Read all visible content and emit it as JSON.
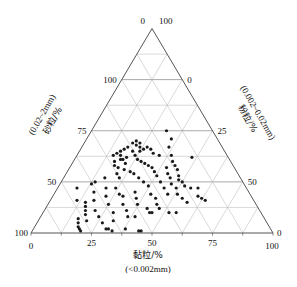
{
  "figure": {
    "title": "",
    "background_color": "#ffffff",
    "width": 297,
    "height": 287
  },
  "axes": {
    "bottom": {
      "name": "clay",
      "label_cjk": "黏粒/%",
      "label_range": "(<0.002mm)",
      "ticks": [
        "0",
        "25",
        "50",
        "75",
        "100"
      ],
      "tick_values": [
        0,
        25,
        50,
        75,
        100
      ],
      "direction": "left-to-right"
    },
    "left": {
      "name": "sand",
      "label_cjk": "砂粒/%",
      "label_range": "(0.02~2mm)",
      "ticks": [
        "100",
        "75",
        "50",
        "25",
        "0"
      ],
      "tick_values": [
        100,
        75,
        50,
        25,
        0
      ],
      "direction": "bottom-to-top"
    },
    "right": {
      "name": "silt",
      "label_cjk": "粉粒/%",
      "label_range": "(0.002~0.02mm)",
      "ticks": [
        "0",
        "25",
        "50",
        "75",
        "100"
      ],
      "tick_values": [
        0,
        25,
        50,
        75,
        100
      ],
      "direction": "bottom-to-top"
    }
  },
  "corner_labels": {
    "top_left_of_apex": "0",
    "top_right_of_apex": "100",
    "bottom_left_upper": "100",
    "bottom_left_lower": "0",
    "bottom_right_upper": "0",
    "bottom_right_lower": "100"
  },
  "style": {
    "border_color": "#555555",
    "grid_color": "#b9b9b9",
    "grid_major_color": "#9a9a9a",
    "point_color": "#1a1a1a",
    "point_radius": 1.6,
    "grid_interval": 12.5,
    "grid_labeled_interval": 25
  },
  "chart_data": {
    "type": "scatter",
    "subtype": "ternary",
    "title": "",
    "xlabel": "黏粒/% (<0.002mm)",
    "ylabel": "砂粒/% (0.02~2mm)",
    "zlabel": "粉粒/% (0.002~0.02mm)",
    "axis_order": [
      "clay",
      "silt",
      "sand"
    ],
    "xlim": [
      0,
      100
    ],
    "grid": true,
    "legend": "none",
    "n_points": 118,
    "series": [
      {
        "name": "soil samples",
        "marker": "filled-circle",
        "color": "#1a1a1a",
        "points": [
          {
            "clay": 31,
            "silt": 19,
            "sand": 50
          },
          {
            "clay": 35,
            "silt": 19,
            "sand": 46
          },
          {
            "clay": 36,
            "silt": 22,
            "sand": 42
          },
          {
            "clay": 39,
            "silt": 23,
            "sand": 38
          },
          {
            "clay": 41,
            "silt": 24,
            "sand": 35
          },
          {
            "clay": 43,
            "silt": 24,
            "sand": 33
          },
          {
            "clay": 45,
            "silt": 24,
            "sand": 31
          },
          {
            "clay": 47,
            "silt": 25,
            "sand": 28
          },
          {
            "clay": 48,
            "silt": 26,
            "sand": 26
          },
          {
            "clay": 50,
            "silt": 25,
            "sand": 25
          },
          {
            "clay": 52,
            "silt": 25,
            "sand": 23
          },
          {
            "clay": 55,
            "silt": 23,
            "sand": 22
          },
          {
            "clay": 58,
            "silt": 20,
            "sand": 22
          },
          {
            "clay": 60,
            "silt": 22,
            "sand": 18
          },
          {
            "clay": 62,
            "silt": 21,
            "sand": 17
          },
          {
            "clay": 64,
            "silt": 20,
            "sand": 16
          },
          {
            "clay": 40,
            "silt": 28,
            "sand": 32
          },
          {
            "clay": 42,
            "silt": 29,
            "sand": 29
          },
          {
            "clay": 44,
            "silt": 29,
            "sand": 27
          },
          {
            "clay": 46,
            "silt": 30,
            "sand": 24
          },
          {
            "clay": 49,
            "silt": 29,
            "sand": 22
          },
          {
            "clay": 51,
            "silt": 30,
            "sand": 19
          },
          {
            "clay": 54,
            "silt": 29,
            "sand": 17
          },
          {
            "clay": 57,
            "silt": 28,
            "sand": 15
          },
          {
            "clay": 34,
            "silt": 28,
            "sand": 38
          },
          {
            "clay": 31,
            "silt": 30,
            "sand": 39
          },
          {
            "clay": 29,
            "silt": 30,
            "sand": 41
          },
          {
            "clay": 27,
            "silt": 31,
            "sand": 42
          },
          {
            "clay": 26,
            "silt": 33,
            "sand": 41
          },
          {
            "clay": 25,
            "silt": 35,
            "sand": 40
          },
          {
            "clay": 24,
            "silt": 34,
            "sand": 42
          },
          {
            "clay": 23,
            "silt": 33,
            "sand": 44
          },
          {
            "clay": 22,
            "silt": 35,
            "sand": 43
          },
          {
            "clay": 21,
            "silt": 34,
            "sand": 45
          },
          {
            "clay": 20,
            "silt": 36,
            "sand": 44
          },
          {
            "clay": 22,
            "silt": 38,
            "sand": 40
          },
          {
            "clay": 24,
            "silt": 38,
            "sand": 38
          },
          {
            "clay": 26,
            "silt": 38,
            "sand": 36
          },
          {
            "clay": 28,
            "silt": 37,
            "sand": 35
          },
          {
            "clay": 30,
            "silt": 36,
            "sand": 34
          },
          {
            "clay": 32,
            "silt": 35,
            "sand": 33
          },
          {
            "clay": 34,
            "silt": 34,
            "sand": 32
          },
          {
            "clay": 36,
            "silt": 34,
            "sand": 30
          },
          {
            "clay": 38,
            "silt": 34,
            "sand": 28
          },
          {
            "clay": 41,
            "silt": 34,
            "sand": 25
          },
          {
            "clay": 44,
            "silt": 34,
            "sand": 22
          },
          {
            "clay": 47,
            "silt": 34,
            "sand": 19
          },
          {
            "clay": 19,
            "silt": 39,
            "sand": 42
          },
          {
            "clay": 18,
            "silt": 41,
            "sand": 41
          },
          {
            "clay": 17,
            "silt": 43,
            "sand": 40
          },
          {
            "clay": 18,
            "silt": 44,
            "sand": 38
          },
          {
            "clay": 19,
            "silt": 45,
            "sand": 36
          },
          {
            "clay": 20,
            "silt": 44,
            "sand": 36
          },
          {
            "clay": 21,
            "silt": 42,
            "sand": 37
          },
          {
            "clay": 22,
            "silt": 44,
            "sand": 34
          },
          {
            "clay": 23,
            "silt": 46,
            "sand": 31
          },
          {
            "clay": 16,
            "silt": 45,
            "sand": 39
          },
          {
            "clay": 15,
            "silt": 47,
            "sand": 38
          },
          {
            "clay": 17,
            "silt": 48,
            "sand": 35
          },
          {
            "clay": 18,
            "silt": 49,
            "sand": 33
          },
          {
            "clay": 20,
            "silt": 48,
            "sand": 32
          },
          {
            "clay": 21,
            "silt": 50,
            "sand": 29
          },
          {
            "clay": 23,
            "silt": 50,
            "sand": 27
          },
          {
            "clay": 26,
            "silt": 44,
            "sand": 30
          },
          {
            "clay": 28,
            "silt": 43,
            "sand": 29
          },
          {
            "clay": 31,
            "silt": 42,
            "sand": 27
          },
          {
            "clay": 34,
            "silt": 41,
            "sand": 25
          },
          {
            "clay": 37,
            "silt": 40,
            "sand": 23
          },
          {
            "clay": 40,
            "silt": 41,
            "sand": 19
          },
          {
            "clay": 43,
            "silt": 40,
            "sand": 17
          },
          {
            "clay": 45,
            "silt": 41,
            "sand": 14
          },
          {
            "clay": 47,
            "silt": 41,
            "sand": 12
          },
          {
            "clay": 33,
            "silt": 47,
            "sand": 20
          },
          {
            "clay": 35,
            "silt": 48,
            "sand": 17
          },
          {
            "clay": 37,
            "silt": 49,
            "sand": 14
          },
          {
            "clay": 42,
            "silt": 46,
            "sand": 12
          },
          {
            "clay": 44,
            "silt": 46,
            "sand": 10
          },
          {
            "clay": 45,
            "silt": 45,
            "sand": 10
          },
          {
            "clay": 55,
            "silt": 35,
            "sand": 10
          },
          {
            "clay": 24,
            "silt": 54,
            "sand": 22
          },
          {
            "clay": 27,
            "silt": 54,
            "sand": 19
          },
          {
            "clay": 29,
            "silt": 53,
            "sand": 18
          },
          {
            "clay": 31,
            "silt": 55,
            "sand": 14
          },
          {
            "clay": 34,
            "silt": 55,
            "sand": 11
          },
          {
            "clay": 36,
            "silt": 56,
            "sand": 8
          },
          {
            "clay": 39,
            "silt": 53,
            "sand": 8
          },
          {
            "clay": 17,
            "silt": 56,
            "sand": 27
          },
          {
            "clay": 20,
            "silt": 58,
            "sand": 22
          },
          {
            "clay": 22,
            "silt": 60,
            "sand": 18
          },
          {
            "clay": 25,
            "silt": 61,
            "sand": 14
          },
          {
            "clay": 29,
            "silt": 61,
            "sand": 10
          },
          {
            "clay": 31,
            "silt": 63,
            "sand": 6
          },
          {
            "clay": 14,
            "silt": 61,
            "sand": 25
          },
          {
            "clay": 13,
            "silt": 63,
            "sand": 24
          },
          {
            "clay": 16,
            "silt": 64,
            "sand": 20
          },
          {
            "clay": 18,
            "silt": 66,
            "sand": 16
          },
          {
            "clay": 21,
            "silt": 68,
            "sand": 11
          },
          {
            "clay": 24,
            "silt": 68,
            "sand": 8
          },
          {
            "clay": 27,
            "silt": 68,
            "sand": 5
          },
          {
            "clay": 15,
            "silt": 70,
            "sand": 15
          },
          {
            "clay": 16,
            "silt": 71,
            "sand": 13
          },
          {
            "clay": 17,
            "silt": 72,
            "sand": 11
          },
          {
            "clay": 18,
            "silt": 73,
            "sand": 9
          },
          {
            "clay": 20,
            "silt": 74,
            "sand": 6
          },
          {
            "clay": 8,
            "silt": 70,
            "sand": 22
          },
          {
            "clay": 11,
            "silt": 73,
            "sand": 16
          },
          {
            "clay": 16,
            "silt": 77,
            "sand": 7
          },
          {
            "clay": 17,
            "silt": 78,
            "sand": 5
          },
          {
            "clay": 18,
            "silt": 79,
            "sand": 3
          },
          {
            "clay": 19,
            "silt": 79,
            "sand": 2
          },
          {
            "clay": 20,
            "silt": 79,
            "sand": 1
          },
          {
            "clay": 30,
            "silt": 68,
            "sand": 2
          },
          {
            "clay": 31,
            "silt": 67,
            "sand": 2
          },
          {
            "clay": 33,
            "silt": 66,
            "sand": 1
          },
          {
            "clay": 44,
            "silt": 55,
            "sand": 1
          },
          {
            "clay": 45,
            "silt": 54,
            "sand": 1
          },
          {
            "clay": 38,
            "silt": 60,
            "sand": 2
          },
          {
            "clay": 52,
            "silt": 38,
            "sand": 10
          },
          {
            "clay": 48,
            "silt": 15,
            "sand": 37
          }
        ]
      }
    ]
  }
}
